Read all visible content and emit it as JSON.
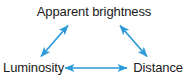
{
  "diagram": {
    "type": "concept-triangle",
    "background_color": "#ffffff",
    "text_color": "#1a1a1a",
    "arrow_color": "#2b9ad9",
    "nodes": [
      {
        "id": "apparent-brightness",
        "label": "Apparent brightness",
        "position": "top-center"
      },
      {
        "id": "luminosity",
        "label": "Luminosity",
        "position": "bottom-left"
      },
      {
        "id": "distance",
        "label": "Distance",
        "position": "bottom-right"
      }
    ],
    "edges": [
      {
        "id": "luminosity-apparent-brightness",
        "from": "luminosity",
        "to": "apparent-brightness",
        "arrowheads": "both"
      },
      {
        "id": "apparent-brightness-distance",
        "from": "apparent-brightness",
        "to": "distance",
        "arrowheads": "both"
      },
      {
        "id": "luminosity-distance",
        "from": "luminosity",
        "to": "distance",
        "arrowheads": "both"
      }
    ]
  }
}
